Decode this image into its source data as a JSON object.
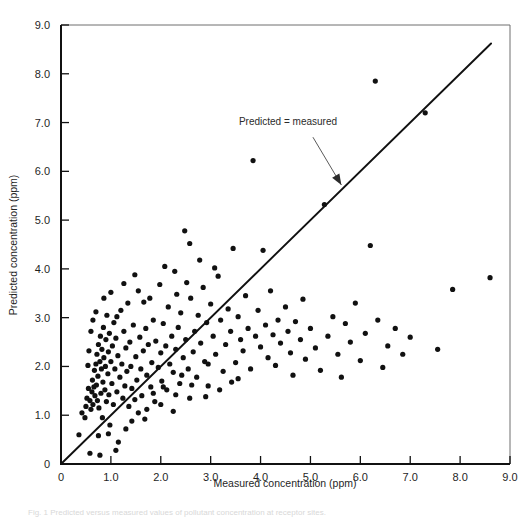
{
  "figure": {
    "caption": "Fig. 1 Predicted versus measured values of pollutant concentration at receptor sites."
  },
  "chart_data": {
    "type": "scatter",
    "title": "",
    "xlabel": "Measured concentration (ppm)",
    "ylabel": "Predicted concentration (ppm)",
    "xlim": [
      0,
      9
    ],
    "ylim": [
      0,
      9
    ],
    "xticks": [
      "0",
      "1.0",
      "2.0",
      "3.0",
      "4.0",
      "5.0",
      "6.0",
      "7.0",
      "8.0",
      "9.0"
    ],
    "xtick_values": [
      0,
      1,
      2,
      3,
      4,
      5,
      6,
      7,
      8,
      9
    ],
    "yticks": [
      "0",
      "1.0",
      "2.0",
      "3.0",
      "4.0",
      "5.0",
      "6.0",
      "7.0",
      "8.0",
      "9.0"
    ],
    "ytick_values": [
      0,
      1,
      2,
      3,
      4,
      5,
      6,
      7,
      8,
      9
    ],
    "grid": false,
    "legend": null,
    "marker": "filled-circle",
    "marker_color": "#111111",
    "marker_size": 2.6,
    "annotations": [
      {
        "text": "Predicted = measured",
        "x": 4.55,
        "y": 6.95,
        "arrow_from": [
          5.05,
          6.7
        ],
        "arrow_to": [
          5.62,
          5.72
        ]
      }
    ],
    "reference_line": {
      "label": "Predicted = measured",
      "slope": 1,
      "intercept": 0,
      "x_start": 0,
      "x_end": 8.62,
      "y_start": 0,
      "y_end": 8.62,
      "color": "#111111"
    },
    "series": [
      {
        "name": "observations",
        "points": [
          [
            0.36,
            0.6
          ],
          [
            0.48,
            0.95
          ],
          [
            0.52,
            1.35
          ],
          [
            0.55,
            1.55
          ],
          [
            0.58,
            1.3
          ],
          [
            0.6,
            1.12
          ],
          [
            0.62,
            1.48
          ],
          [
            0.63,
            1.72
          ],
          [
            0.64,
            1.22
          ],
          [
            0.66,
            1.58
          ],
          [
            0.67,
            1.92
          ],
          [
            0.68,
            1.4
          ],
          [
            0.7,
            2.05
          ],
          [
            0.71,
            1.62
          ],
          [
            0.72,
            2.25
          ],
          [
            0.73,
            1.3
          ],
          [
            0.74,
            1.8
          ],
          [
            0.75,
            2.45
          ],
          [
            0.76,
            1.15
          ],
          [
            0.78,
            2.1
          ],
          [
            0.79,
            2.62
          ],
          [
            0.8,
            1.45
          ],
          [
            0.81,
            1.95
          ],
          [
            0.82,
            2.35
          ],
          [
            0.83,
            0.95
          ],
          [
            0.84,
            1.68
          ],
          [
            0.85,
            2.8
          ],
          [
            0.86,
            2.18
          ],
          [
            0.88,
            1.52
          ],
          [
            0.89,
            2.0
          ],
          [
            0.9,
            2.55
          ],
          [
            0.91,
            1.28
          ],
          [
            0.92,
            3.05
          ],
          [
            0.94,
            1.85
          ],
          [
            0.95,
            2.3
          ],
          [
            0.96,
            1.42
          ],
          [
            0.97,
            2.68
          ],
          [
            0.98,
            0.8
          ],
          [
            1.0,
            2.1
          ],
          [
            1.02,
            1.65
          ],
          [
            1.03,
            2.42
          ],
          [
            1.05,
            1.22
          ],
          [
            1.06,
            2.9
          ],
          [
            1.08,
            1.95
          ],
          [
            1.1,
            2.58
          ],
          [
            1.12,
            1.48
          ],
          [
            1.14,
            2.22
          ],
          [
            1.15,
            0.45
          ],
          [
            1.18,
            1.78
          ],
          [
            1.2,
            3.15
          ],
          [
            1.22,
            2.05
          ],
          [
            1.24,
            1.35
          ],
          [
            1.26,
            2.72
          ],
          [
            1.28,
            1.6
          ],
          [
            1.3,
            2.38
          ],
          [
            1.32,
            1.9
          ],
          [
            1.34,
            3.3
          ],
          [
            1.36,
            1.18
          ],
          [
            1.38,
            2.5
          ],
          [
            1.4,
            2.0
          ],
          [
            1.42,
            1.55
          ],
          [
            1.45,
            2.85
          ],
          [
            1.48,
            1.32
          ],
          [
            1.5,
            2.2
          ],
          [
            1.52,
            1.72
          ],
          [
            1.55,
            3.55
          ],
          [
            1.58,
            2.6
          ],
          [
            1.6,
            1.95
          ],
          [
            1.62,
            1.4
          ],
          [
            1.65,
            2.32
          ],
          [
            1.68,
            0.92
          ],
          [
            1.7,
            2.78
          ],
          [
            1.72,
            1.82
          ],
          [
            1.75,
            2.45
          ],
          [
            1.78,
            3.4
          ],
          [
            1.8,
            1.58
          ],
          [
            1.82,
            2.08
          ],
          [
            1.85,
            2.95
          ],
          [
            1.88,
            1.28
          ],
          [
            1.9,
            2.52
          ],
          [
            1.95,
            1.98
          ],
          [
            1.98,
            3.68
          ],
          [
            2.0,
            2.28
          ],
          [
            2.02,
            1.7
          ],
          [
            2.05,
            2.88
          ],
          [
            2.1,
            2.42
          ],
          [
            2.12,
            1.52
          ],
          [
            2.15,
            3.22
          ],
          [
            2.18,
            2.05
          ],
          [
            2.22,
            2.62
          ],
          [
            2.25,
            1.88
          ],
          [
            2.28,
            3.95
          ],
          [
            2.3,
            2.35
          ],
          [
            2.35,
            2.8
          ],
          [
            2.38,
            1.65
          ],
          [
            2.4,
            3.1
          ],
          [
            2.45,
            2.18
          ],
          [
            2.48,
            4.78
          ],
          [
            2.5,
            2.55
          ],
          [
            2.55,
            1.95
          ],
          [
            2.58,
            4.52
          ],
          [
            2.6,
            3.4
          ],
          [
            2.65,
            2.3
          ],
          [
            2.68,
            2.72
          ],
          [
            2.72,
            1.78
          ],
          [
            2.75,
            3.05
          ],
          [
            2.8,
            2.48
          ],
          [
            2.85,
            3.62
          ],
          [
            2.88,
            2.1
          ],
          [
            2.92,
            2.9
          ],
          [
            2.95,
            1.6
          ],
          [
            3.0,
            3.28
          ],
          [
            3.05,
            2.62
          ],
          [
            3.1,
            2.25
          ],
          [
            3.15,
            3.85
          ],
          [
            3.2,
            2.95
          ],
          [
            3.25,
            1.9
          ],
          [
            3.3,
            2.45
          ],
          [
            3.35,
            3.18
          ],
          [
            3.4,
            2.72
          ],
          [
            3.45,
            4.42
          ],
          [
            3.5,
            2.08
          ],
          [
            3.55,
            3.02
          ],
          [
            3.6,
            2.55
          ],
          [
            3.65,
            2.32
          ],
          [
            3.7,
            3.45
          ],
          [
            3.75,
            2.78
          ],
          [
            3.8,
            1.95
          ],
          [
            3.85,
            6.22
          ],
          [
            3.9,
            2.62
          ],
          [
            3.95,
            3.15
          ],
          [
            4.0,
            2.4
          ],
          [
            4.05,
            4.38
          ],
          [
            4.1,
            2.85
          ],
          [
            4.15,
            2.18
          ],
          [
            4.2,
            3.55
          ],
          [
            4.25,
            2.65
          ],
          [
            4.3,
            2.02
          ],
          [
            4.35,
            2.95
          ],
          [
            4.4,
            2.48
          ],
          [
            4.5,
            3.22
          ],
          [
            4.55,
            2.72
          ],
          [
            4.6,
            2.28
          ],
          [
            4.65,
            1.82
          ],
          [
            4.7,
            2.92
          ],
          [
            4.8,
            2.55
          ],
          [
            4.85,
            3.38
          ],
          [
            4.9,
            2.15
          ],
          [
            5.0,
            2.78
          ],
          [
            5.1,
            2.38
          ],
          [
            5.2,
            1.92
          ],
          [
            5.28,
            5.32
          ],
          [
            5.35,
            2.62
          ],
          [
            5.45,
            3.02
          ],
          [
            5.55,
            2.25
          ],
          [
            5.62,
            1.78
          ],
          [
            5.7,
            2.88
          ],
          [
            5.8,
            2.5
          ],
          [
            5.9,
            3.3
          ],
          [
            6.0,
            2.12
          ],
          [
            6.1,
            2.68
          ],
          [
            6.2,
            4.48
          ],
          [
            6.3,
            7.85
          ],
          [
            6.35,
            2.95
          ],
          [
            6.45,
            1.98
          ],
          [
            6.55,
            2.42
          ],
          [
            6.7,
            2.78
          ],
          [
            6.85,
            2.25
          ],
          [
            7.0,
            2.6
          ],
          [
            7.3,
            7.2
          ],
          [
            7.55,
            2.35
          ],
          [
            7.85,
            3.58
          ],
          [
            8.6,
            3.82
          ],
          [
            0.58,
            0.22
          ],
          [
            0.75,
            0.58
          ],
          [
            0.78,
            0.18
          ],
          [
            1.1,
            0.28
          ],
          [
            0.95,
            0.62
          ],
          [
            1.3,
            0.72
          ],
          [
            1.42,
            0.88
          ],
          [
            0.42,
            1.05
          ],
          [
            0.5,
            1.18
          ],
          [
            0.54,
            2.02
          ],
          [
            0.56,
            2.32
          ],
          [
            0.6,
            2.72
          ],
          [
            0.64,
            2.95
          ],
          [
            0.7,
            3.12
          ],
          [
            0.86,
            3.4
          ],
          [
            1.0,
            3.52
          ],
          [
            1.12,
            3.02
          ],
          [
            1.26,
            3.7
          ],
          [
            1.48,
            3.88
          ],
          [
            1.66,
            3.32
          ],
          [
            2.08,
            4.05
          ],
          [
            2.32,
            3.48
          ],
          [
            2.52,
            3.72
          ],
          [
            2.78,
            4.18
          ],
          [
            3.08,
            4.02
          ],
          [
            1.55,
            1.05
          ],
          [
            1.72,
            1.12
          ],
          [
            2.0,
            1.22
          ],
          [
            2.25,
            1.08
          ],
          [
            2.58,
            1.35
          ],
          [
            2.05,
            1.58
          ],
          [
            2.3,
            1.42
          ],
          [
            2.62,
            1.62
          ],
          [
            2.9,
            1.38
          ],
          [
            3.18,
            1.52
          ],
          [
            3.42,
            1.68
          ],
          [
            1.85,
            1.45
          ],
          [
            2.42,
            1.82
          ],
          [
            2.95,
            2.05
          ],
          [
            3.55,
            1.75
          ]
        ]
      }
    ]
  }
}
